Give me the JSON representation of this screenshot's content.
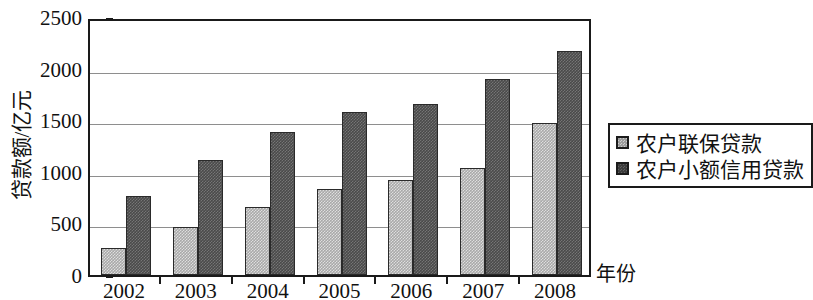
{
  "chart_data": {
    "type": "bar",
    "title": "",
    "xlabel": "年份",
    "ylabel": "贷款额/亿元",
    "categories": [
      "2002",
      "2003",
      "2004",
      "2005",
      "2006",
      "2007",
      "2008"
    ],
    "series": [
      {
        "name": "农户联保贷款",
        "color": "#a9a9a9",
        "values": [
          262,
          465,
          660,
          830,
          925,
          1035,
          1470
        ]
      },
      {
        "name": "农户小额信用贷款",
        "color": "#4a4a4a",
        "values": [
          768,
          1115,
          1390,
          1580,
          1660,
          1900,
          2175
        ]
      }
    ],
    "ylim": [
      0,
      2500
    ],
    "yticks": [
      0,
      500,
      1000,
      1500,
      2000,
      2500
    ],
    "ytick_labels": [
      "0",
      "500",
      "1000",
      "1500",
      "2000",
      "2500"
    ],
    "grid": "horizontal",
    "legend_position": "right"
  },
  "legend": {
    "entries": [
      {
        "label": "农户联保贷款",
        "swatch": "light"
      },
      {
        "label": "农户小额信用贷款",
        "swatch": "dark"
      }
    ]
  }
}
